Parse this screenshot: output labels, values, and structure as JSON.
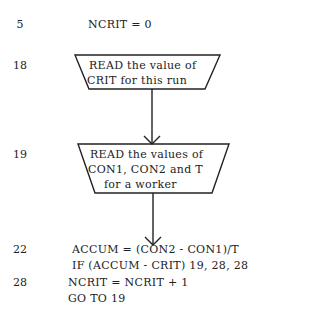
{
  "statements": [
    {
      "line": "5",
      "code": [
        "NCRIT = 0"
      ]
    },
    {
      "line": "18",
      "box": [
        "READ the value of",
        "CRIT for this run"
      ]
    },
    {
      "line": "19",
      "box": [
        "READ the values of",
        "CON1, CON2 and T",
        "for a worker"
      ]
    },
    {
      "line": "22",
      "code": [
        "ACCUM = (CON2 - CON1)/T",
        "IF (ACCUM - CRIT) 19, 28, 28"
      ]
    },
    {
      "line": "28",
      "code": [
        "NCRIT = NCRIT + 1",
        "GO TO 19"
      ]
    }
  ]
}
